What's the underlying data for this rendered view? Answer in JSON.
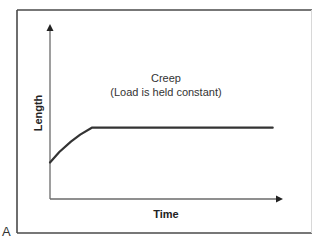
{
  "panel_label": "A",
  "chart_data": {
    "type": "line",
    "title": "Creep",
    "subtitle": "(Load is held constant)",
    "xlabel": "Time",
    "ylabel": "Length",
    "xlim": [
      0,
      1
    ],
    "ylim": [
      0,
      1
    ],
    "units_note": "conceptual, unitless (no ticks shown)",
    "grid": false,
    "legend": "none",
    "series": [
      {
        "name": "Creep curve",
        "x": [
          0.0,
          0.04,
          0.09,
          0.13,
          0.18,
          0.96
        ],
        "y": [
          0.21,
          0.27,
          0.33,
          0.37,
          0.41,
          0.41
        ]
      }
    ]
  }
}
